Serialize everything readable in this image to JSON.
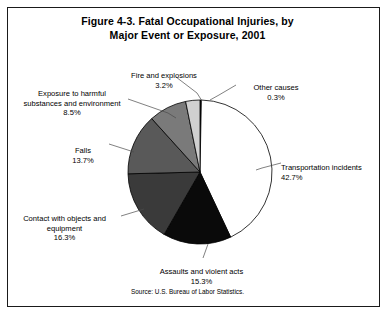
{
  "figure": {
    "title_line1": "Figure 4-3. Fatal Occupational Injuries, by",
    "title_line2": "Major Event or Exposure, 2001",
    "source": "Source: U.S. Bureau of Labor Statistics."
  },
  "labels": {
    "fire_name": "Fire and explosions",
    "fire_pct": "3.2%",
    "other_name": "Other causes",
    "other_pct": "0.3%",
    "exposure_name": "Exposure to harmful\nsubstances and environment",
    "exposure_pct": "8.5%",
    "falls_name": "Falls",
    "falls_pct": "13.7%",
    "contact_name": "Contact with objects and\nequipment",
    "contact_pct": "16.3%",
    "transport_name": "Transportation incidents",
    "transport_pct": "42.7%",
    "assaults_name": "Assaults and violent acts",
    "assaults_pct": "15.3%"
  },
  "chart_data": {
    "type": "pie",
    "title": "Figure 4-3. Fatal Occupational Injuries, by Major Event or Exposure, 2001",
    "subtitle": "",
    "xlabel": "",
    "ylabel": "",
    "units": "percent",
    "start_angle_deg": 0,
    "direction": "clockwise",
    "legend": "none",
    "labels_position": "outside-with-leader-lines",
    "source": "Source: U.S. Bureau of Labor Statistics.",
    "categories": [
      "Other causes",
      "Transportation incidents",
      "Assaults and violent acts",
      "Contact with objects and equipment",
      "Falls",
      "Exposure to harmful substances and environment",
      "Fire and explosions"
    ],
    "values": [
      0.3,
      42.7,
      15.3,
      16.3,
      13.7,
      8.5,
      3.2
    ],
    "colors": [
      "#1a1a1a",
      "#ffffff",
      "#0a0a0a",
      "#3a3a3a",
      "#595959",
      "#7a7a7a",
      "#d0d0d0"
    ],
    "slice_edge_color": "#000000",
    "geometry": {
      "center_x": 200,
      "center_y": 172,
      "radius": 72
    }
  }
}
